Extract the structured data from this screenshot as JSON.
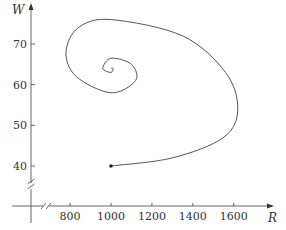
{
  "chart_data": {
    "type": "line",
    "title": "",
    "xlabel": "R",
    "ylabel": "W",
    "xlim": [
      600,
      1750
    ],
    "ylim": [
      30,
      80
    ],
    "x_ticks": [
      800,
      1000,
      1200,
      1400,
      1600
    ],
    "x_tick_labels": [
      "800",
      "1000",
      "1200",
      "1400",
      "1600"
    ],
    "y_ticks": [
      40,
      50,
      60,
      70
    ],
    "y_tick_labels": [
      "40",
      "50",
      "60",
      "70"
    ],
    "axis_breaks": [
      "x",
      "y"
    ],
    "grid": false,
    "legend": null,
    "series": [
      {
        "name": "phase trajectory",
        "start_point": {
          "R": 1000,
          "W": 40
        },
        "equilibrium": {
          "R": 1000,
          "W": 64
        },
        "points": [
          {
            "R": 1000,
            "W": 40
          },
          {
            "R": 1300,
            "W": 42
          },
          {
            "R": 1550,
            "W": 47
          },
          {
            "R": 1620,
            "W": 54
          },
          {
            "R": 1560,
            "W": 63
          },
          {
            "R": 1350,
            "W": 72
          },
          {
            "R": 1000,
            "W": 76
          },
          {
            "R": 840,
            "W": 74
          },
          {
            "R": 780,
            "W": 68
          },
          {
            "R": 830,
            "W": 62
          },
          {
            "R": 1000,
            "W": 58
          },
          {
            "R": 1120,
            "W": 61
          },
          {
            "R": 1100,
            "W": 65
          },
          {
            "R": 1000,
            "W": 66.5
          },
          {
            "R": 960,
            "W": 64
          },
          {
            "R": 1000,
            "W": 63
          },
          {
            "R": 1010,
            "W": 64
          },
          {
            "R": 1000,
            "W": 64
          }
        ]
      }
    ],
    "color": "#555555"
  }
}
